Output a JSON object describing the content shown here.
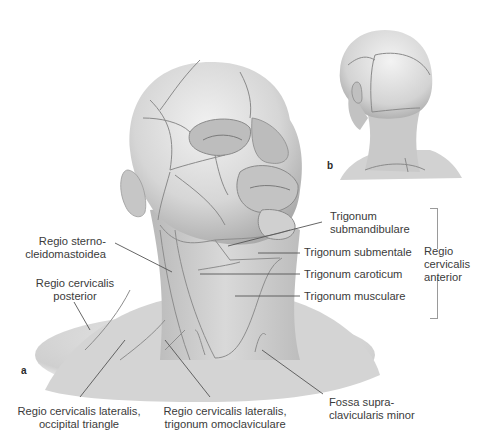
{
  "figure": {
    "panels": [
      {
        "letter": "a",
        "view": "anterolateral view of head and neck"
      },
      {
        "letter": "b",
        "view": "posterior view of head and neck"
      }
    ]
  },
  "labels": {
    "trigonum_submandibulare": [
      "Trigonum",
      "submandibulare"
    ],
    "trigonum_submentale": "Trigonum submentale",
    "trigonum_caroticum": "Trigonum caroticum",
    "trigonum_musculare": "Trigonum musculare",
    "regio_cervicalis_anterior": [
      "Regio",
      "cervicalis",
      "anterior"
    ],
    "regio_sternocleidomastoidea": [
      "Regio sterno-",
      "cleidomastoidea"
    ],
    "regio_cervicalis_posterior": [
      "Regio cervicalis",
      "posterior"
    ],
    "regio_cervicalis_lateralis_occipital": [
      "Regio cervicalis lateralis,",
      "occipital triangle"
    ],
    "regio_cervicalis_lateralis_omoclaviculare": [
      "Regio cervicalis lateralis,",
      "trigonum omoclaviculare"
    ],
    "fossa_supraclavicularis_minor": [
      "Fossa supra-",
      "clavicularis minor"
    ]
  },
  "colors": {
    "skin_light": "#e6e6e6",
    "skin_mid": "#c9c9c9",
    "skin_dark": "#9d9d9d",
    "region_line": "#8a8a8a",
    "leader_line": "#555555",
    "text": "#3b3b3b"
  }
}
